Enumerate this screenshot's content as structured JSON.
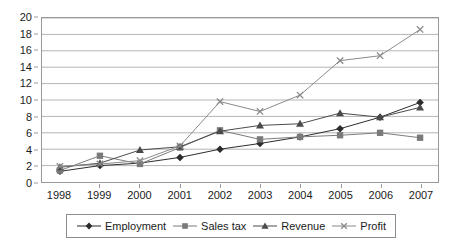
{
  "chart_data": {
    "type": "line",
    "title": "",
    "xlabel": "",
    "ylabel": "",
    "categories": [
      "1998",
      "1999",
      "2000",
      "2001",
      "2002",
      "2003",
      "2004",
      "2005",
      "2006",
      "2007"
    ],
    "x": [
      1998,
      1999,
      2000,
      2001,
      2002,
      2003,
      2004,
      2005,
      2006,
      2007
    ],
    "ylim": [
      0,
      20
    ],
    "xlim": [
      1998,
      2007
    ],
    "y_ticks": [
      0,
      2,
      4,
      6,
      8,
      10,
      12,
      14,
      16,
      18,
      20
    ],
    "grid": true,
    "grid_axis": "y",
    "legend_position": "bottom",
    "series": [
      {
        "name": "Employment",
        "marker": "diamond",
        "color": "#2b2b2b",
        "values": [
          1.3,
          2.0,
          2.3,
          3.0,
          4.0,
          4.7,
          5.5,
          6.5,
          7.9,
          9.7
        ]
      },
      {
        "name": "Sales tax",
        "marker": "square",
        "color": "#7a7a7a",
        "values": [
          1.4,
          3.2,
          2.2,
          4.2,
          6.3,
          5.2,
          5.5,
          5.7,
          6.0,
          5.4
        ]
      },
      {
        "name": "Revenue",
        "marker": "triangle",
        "color": "#4a4a4a",
        "values": [
          1.8,
          2.3,
          3.9,
          4.3,
          6.2,
          6.9,
          7.1,
          8.4,
          7.9,
          9.1
        ]
      },
      {
        "name": "Profit",
        "marker": "x",
        "color": "#8a8a8a",
        "values": [
          1.9,
          2.2,
          2.6,
          4.4,
          9.8,
          8.6,
          10.6,
          14.8,
          15.4,
          18.6
        ]
      }
    ]
  },
  "legend": {
    "items": [
      {
        "label": "Employment"
      },
      {
        "label": "Sales tax"
      },
      {
        "label": "Revenue"
      },
      {
        "label": "Profit"
      }
    ]
  },
  "colors": {
    "plot_border": "#9a9a9a",
    "gridline": "#b3b3b3",
    "background": "#ffffff",
    "text": "#1b1b1b"
  }
}
